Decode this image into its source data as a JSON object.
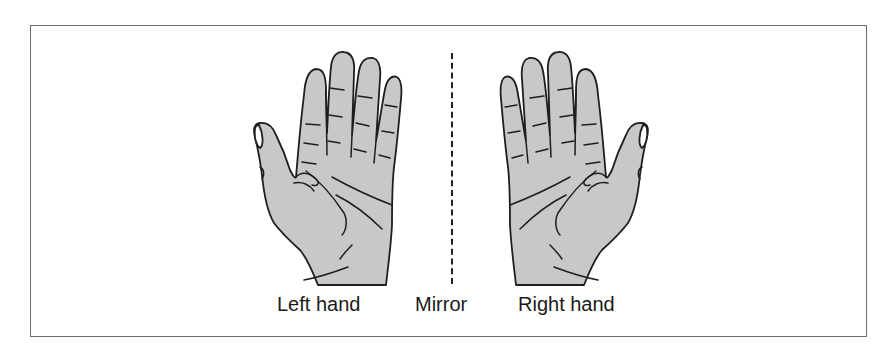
{
  "figure": {
    "labels": {
      "left_hand": "Left hand",
      "mirror": "Mirror",
      "right_hand": "Right hand"
    },
    "colors": {
      "hand_fill": "#c8c8c8",
      "outline": "#1e1e1e",
      "frame_border": "#6e6e6e",
      "background": "#ffffff"
    },
    "icons": {
      "left_hand": "palm-facing-hand-left",
      "right_hand": "palm-facing-hand-right",
      "mirror_line": "dashed-vertical-line"
    }
  }
}
